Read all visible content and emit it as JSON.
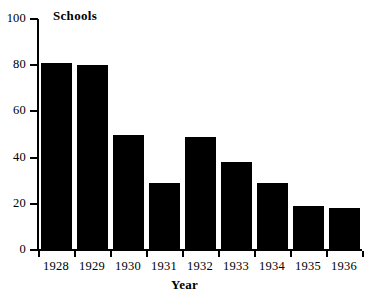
{
  "chart_data": {
    "type": "bar",
    "title": "",
    "xlabel": "Year",
    "ylabel": "Schools",
    "categories": [
      "1928",
      "1929",
      "1930",
      "1931",
      "1932",
      "1933",
      "1934",
      "1935",
      "1936"
    ],
    "values": [
      81,
      80,
      50,
      29,
      49,
      38,
      29,
      19,
      18
    ],
    "ylim": [
      0,
      100
    ],
    "yticks": [
      0,
      20,
      40,
      60,
      80,
      100
    ],
    "ytick_labels": [
      "0",
      "20",
      "40",
      "60",
      "80",
      "100"
    ],
    "grid": false,
    "legend": null,
    "bar_color": "#000000",
    "axis_color": "#000000",
    "background_color": "#ffffff",
    "series": [
      {
        "name": "Schools",
        "values": [
          81,
          80,
          50,
          29,
          49,
          38,
          29,
          19,
          18
        ]
      }
    ]
  }
}
